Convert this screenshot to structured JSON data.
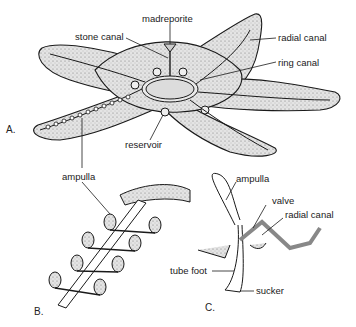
{
  "figure": {
    "panels": [
      {
        "id": "A",
        "label": "A.",
        "subject": "starfish water vascular system"
      },
      {
        "id": "B",
        "label": "B.",
        "subject": "ampullae along radial canal"
      },
      {
        "id": "C",
        "label": "C.",
        "subject": "tube foot cross section"
      }
    ],
    "labels_a": {
      "madreporite": "madreporite",
      "stone_canal": "stone canal",
      "radial_canal": "radial canal",
      "ring_canal": "ring canal",
      "reservoir": "reservoir"
    },
    "labels_b": {
      "ampulla": "ampulla"
    },
    "labels_c": {
      "ampulla": "ampulla",
      "valve": "valve",
      "radial_canal": "radial canal",
      "tube_foot": "tube foot",
      "sucker": "sucker"
    },
    "colors": {
      "body_fill": "#d9d9d9",
      "outline": "#1a1a1a",
      "background": "#ffffff"
    }
  }
}
